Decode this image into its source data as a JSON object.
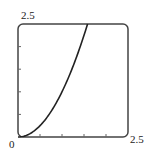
{
  "chart_data": {
    "type": "line",
    "title": "",
    "xlabel": "",
    "ylabel": "",
    "xlim": [
      0,
      2.5
    ],
    "ylim": [
      0,
      2.5
    ],
    "grid": false,
    "x_tick_labels": [
      "0",
      "2.5"
    ],
    "y_tick_labels": [
      "2.5"
    ],
    "x_minor_ticks": [
      0.5,
      1.0,
      1.5,
      2.0
    ],
    "y_minor_ticks": [
      0.5,
      1.0,
      1.5,
      2.0
    ],
    "series": [
      {
        "name": "curve",
        "function": "y = x^2",
        "x": [
          0,
          0.25,
          0.5,
          0.75,
          1.0,
          1.25,
          1.5,
          1.58
        ],
        "y": [
          0,
          0.06,
          0.25,
          0.56,
          1.0,
          1.56,
          2.25,
          2.5
        ]
      }
    ]
  },
  "labels": {
    "origin": "0",
    "x_max": "2.5",
    "y_max": "2.5"
  },
  "colors": {
    "axes": "#444444",
    "curve": "#222222"
  }
}
